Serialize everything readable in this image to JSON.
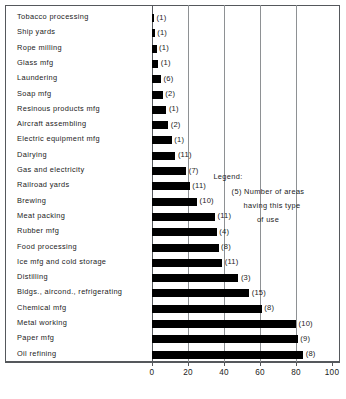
{
  "chart_data": {
    "type": "bar",
    "orientation": "horizontal",
    "title": "",
    "xlabel": "",
    "ylabel": "",
    "xlim": [
      0,
      100
    ],
    "xticks": [
      0,
      20,
      40,
      60,
      80,
      100
    ],
    "grid": true,
    "categories": [
      "Tobacco processing",
      "Ship yards",
      "Rope milling",
      "Glass mfg",
      "Laundering",
      "Soap mfg",
      "Resinous products mfg",
      "Aircraft assembling",
      "Electric equipment mfg",
      "Dairying",
      "Gas and electricity",
      "Railroad yards",
      "Brewing",
      "Meat packing",
      "Rubber mfg",
      "Food processing",
      "Ice mfg and cold storage",
      "Distilling",
      "Bldgs., aircond., refrigerating",
      "Chemical mfg",
      "Metal working",
      "Paper mfg",
      "Oil refining"
    ],
    "values": [
      1,
      1.5,
      2.5,
      3.5,
      5,
      6,
      8,
      9,
      11,
      13,
      19,
      21,
      25,
      35,
      36,
      37,
      39,
      48,
      54,
      61,
      80,
      81,
      84
    ],
    "point_labels": [
      "(1)",
      "(1)",
      "(1)",
      "(1)",
      "(6)",
      "(2)",
      "(1)",
      "(2)",
      "(1)",
      "(11)",
      "(7)",
      "(11)",
      "(10)",
      "(11)",
      "(4)",
      "(8)",
      "(11)",
      "(3)",
      "(15)",
      "(8)",
      "(10)",
      "(9)",
      "(8)"
    ],
    "bar_color": "#000000",
    "axis_color": "#55585c",
    "grid_color": "#8e9194"
  },
  "legend": {
    "title": "Legend:",
    "line1": "(5) Number of areas",
    "line2": "having this type",
    "line3": "of use"
  },
  "xtick_labels": [
    "0",
    "20",
    "40",
    "60",
    "80",
    "100"
  ]
}
